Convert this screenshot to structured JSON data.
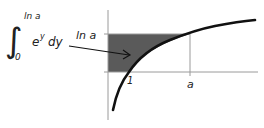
{
  "formula": {
    "integral_sign": "∫",
    "upper_limit": "ln a",
    "lower_limit": "0",
    "integrand": "e",
    "integrand_exponent": "y",
    "differential": "dy"
  },
  "graph": {
    "label_ln_a": "ln a",
    "tick_label_1": "1",
    "tick_label_a": "a",
    "curve": "y = ln x",
    "shaded_region": "area between y-axis and curve, from y = 0 to y = ln a",
    "colors": {
      "shade": "#5a5a5a",
      "axes": "#9a9a9a",
      "curve": "#111111",
      "arrow": "#111111"
    }
  }
}
